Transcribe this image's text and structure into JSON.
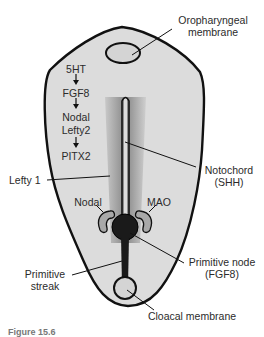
{
  "diagram": {
    "type": "embryo-left-right-axis",
    "colors": {
      "embryo_fill": "#d9d9d9",
      "outline": "#111111",
      "membrane_fill": "#d4d4d4",
      "gradient_dark": "#8a8a8a",
      "gradient_light": "#c8c8c8",
      "node_fill": "#1a1a1a",
      "crescent_fill": "#a8a8a8"
    },
    "labels": {
      "oropharyngeal": [
        "Oropharyngeal",
        "membrane"
      ],
      "cascade": [
        "5HT",
        "FGF8",
        "Nodal",
        "Lefty2",
        "PITX2"
      ],
      "lefty1": "Lefty 1",
      "notochord": [
        "Notochord",
        "(SHH)"
      ],
      "nodal": "Nodal",
      "mao": "MAO",
      "primitive_node": [
        "Primitive node",
        "(FGF8)"
      ],
      "primitive_streak": [
        "Primitive",
        "streak"
      ],
      "cloacal": "Cloacal membrane"
    },
    "caption": "Figure 15.6"
  }
}
